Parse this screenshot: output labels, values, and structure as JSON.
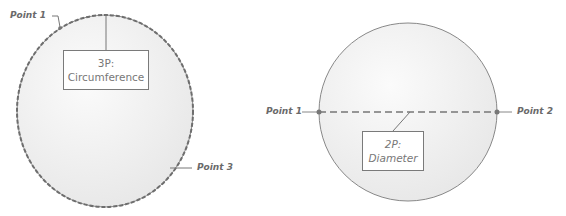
{
  "diagrams": [
    {
      "id": "three-point",
      "label_line1": "3P:",
      "label_line2": "Circumference",
      "points": [
        "Point 1",
        "Point 3"
      ]
    },
    {
      "id": "two-point",
      "label_line1": "2P:",
      "label_line2": "Diameter",
      "points": [
        "Point 1",
        "Point 2"
      ]
    }
  ],
  "colors": {
    "fill": "#f2f2f2",
    "stroke": "#6e6e6e",
    "text": "#6a6a6a"
  }
}
